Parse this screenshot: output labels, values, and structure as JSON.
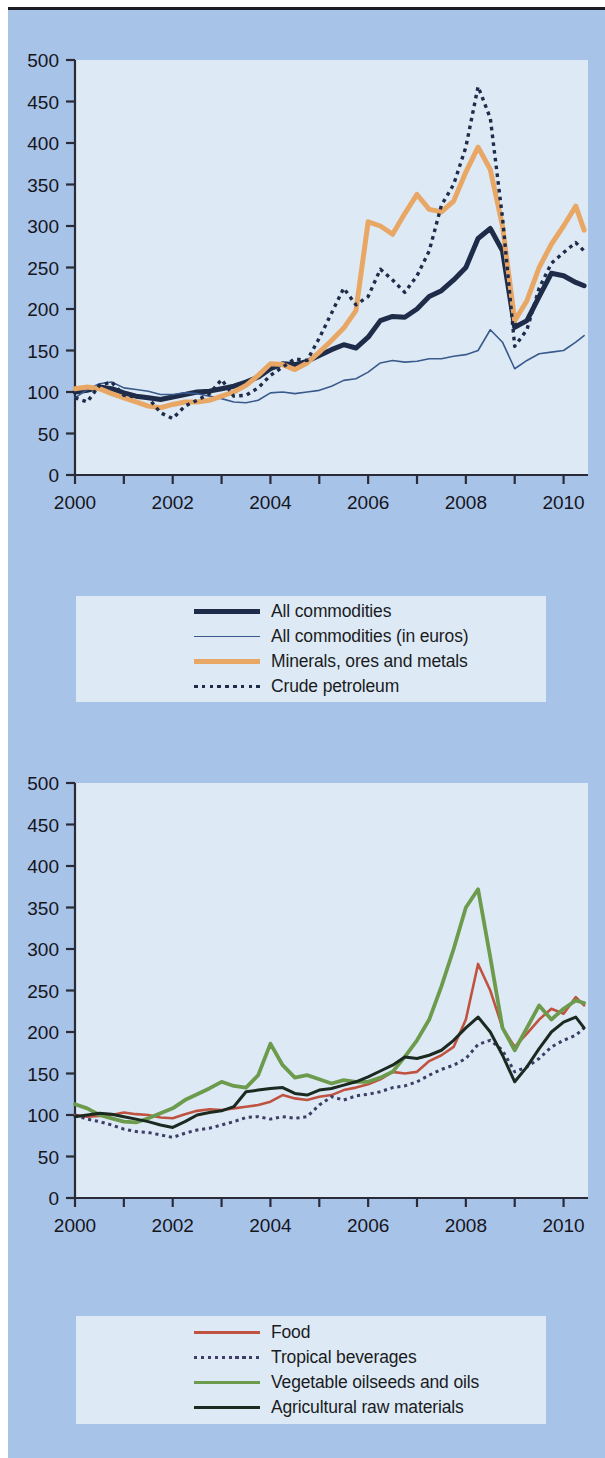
{
  "page": {
    "background_color": "#a8c3e8",
    "panel_color": "#ddeaf6",
    "rule_color": "#1c1c24"
  },
  "charts": [
    {
      "id": "commodity-price-indices-upper",
      "legend": {
        "entries": [
          {
            "label": "All commodities",
            "color": "#1e2c49",
            "style": "solid",
            "width": 5
          },
          {
            "label": "All commodities (in euros)",
            "color": "#3a5a8c",
            "style": "solid",
            "width": 1.6
          },
          {
            "label": "Minerals, ores and metals",
            "color": "#e9a765",
            "style": "solid",
            "width": 5
          },
          {
            "label": "Crude petroleum",
            "color": "#1e2c49",
            "style": "dotted",
            "width": 3.4
          }
        ]
      },
      "chart_data": {
        "type": "line",
        "title": "",
        "xlabel": "",
        "ylabel": "",
        "xlim": [
          2000,
          2010.5
        ],
        "ylim": [
          0,
          500
        ],
        "yticks": [
          0,
          50,
          100,
          150,
          200,
          250,
          300,
          350,
          400,
          450,
          500
        ],
        "xticks": [
          2000,
          2001,
          2002,
          2003,
          2004,
          2005,
          2006,
          2007,
          2008,
          2009,
          2010
        ],
        "xticklabels": [
          "2000",
          "",
          "2002",
          "",
          "2004",
          "",
          "2006",
          "",
          "2008",
          "",
          "2010"
        ],
        "grid": false,
        "legend_position": "below",
        "series": [
          {
            "name": "All commodities",
            "color": "#1e2c49",
            "style": "solid",
            "width": 5,
            "x": [
              2000.0,
              2000.25,
              2000.5,
              2000.75,
              2001.0,
              2001.25,
              2001.5,
              2001.75,
              2002.0,
              2002.25,
              2002.5,
              2002.75,
              2003.0,
              2003.25,
              2003.5,
              2003.75,
              2004.0,
              2004.25,
              2004.5,
              2004.75,
              2005.0,
              2005.25,
              2005.5,
              2005.75,
              2006.0,
              2006.25,
              2006.5,
              2006.75,
              2007.0,
              2007.25,
              2007.5,
              2007.75,
              2008.0,
              2008.25,
              2008.5,
              2008.75,
              2009.0,
              2009.25,
              2009.5,
              2009.75,
              2010.0,
              2010.25,
              2010.42
            ],
            "values": [
              100,
              102,
              106,
              104,
              99,
              95,
              93,
              91,
              94,
              97,
              100,
              101,
              104,
              107,
              112,
              118,
              128,
              134,
              133,
              137,
              144,
              151,
              157,
              153,
              166,
              186,
              191,
              190,
              200,
              215,
              222,
              235,
              250,
              285,
              297,
              270,
              178,
              186,
              215,
              243,
              240,
              232,
              228
            ]
          },
          {
            "name": "All commodities (in euros)",
            "color": "#3a5a8c",
            "style": "solid",
            "width": 1.6,
            "x": [
              2000.0,
              2000.25,
              2000.5,
              2000.75,
              2001.0,
              2001.25,
              2001.5,
              2001.75,
              2002.0,
              2002.25,
              2002.5,
              2002.75,
              2003.0,
              2003.25,
              2003.5,
              2003.75,
              2004.0,
              2004.25,
              2004.5,
              2004.75,
              2005.0,
              2005.25,
              2005.5,
              2005.75,
              2006.0,
              2006.25,
              2006.5,
              2006.75,
              2007.0,
              2007.25,
              2007.5,
              2007.75,
              2008.0,
              2008.25,
              2008.5,
              2008.75,
              2009.0,
              2009.25,
              2009.5,
              2009.75,
              2010.0,
              2010.25,
              2010.42
            ],
            "values": [
              93,
              103,
              110,
              112,
              105,
              103,
              101,
              97,
              97,
              99,
              98,
              95,
              92,
              88,
              87,
              90,
              99,
              100,
              98,
              100,
              102,
              107,
              114,
              116,
              124,
              135,
              138,
              136,
              137,
              140,
              140,
              143,
              145,
              150,
              175,
              160,
              128,
              138,
              146,
              148,
              150,
              160,
              168
            ]
          },
          {
            "name": "Minerals, ores and metals",
            "color": "#e9a765",
            "style": "solid",
            "width": 5,
            "x": [
              2000.0,
              2000.25,
              2000.5,
              2000.75,
              2001.0,
              2001.25,
              2001.5,
              2001.75,
              2002.0,
              2002.25,
              2002.5,
              2002.75,
              2003.0,
              2003.25,
              2003.5,
              2003.75,
              2004.0,
              2004.25,
              2004.5,
              2004.75,
              2005.0,
              2005.25,
              2005.5,
              2005.75,
              2006.0,
              2006.25,
              2006.5,
              2006.75,
              2007.0,
              2007.25,
              2007.5,
              2007.75,
              2008.0,
              2008.25,
              2008.5,
              2008.75,
              2009.0,
              2009.25,
              2009.5,
              2009.75,
              2010.0,
              2010.25,
              2010.42
            ],
            "values": [
              104,
              106,
              104,
              98,
              93,
              88,
              83,
              81,
              85,
              88,
              88,
              90,
              95,
              100,
              108,
              120,
              134,
              133,
              127,
              135,
              148,
              162,
              177,
              198,
              305,
              300,
              290,
              315,
              338,
              320,
              317,
              330,
              365,
              395,
              368,
              300,
              186,
              210,
              250,
              278,
              300,
              324,
              295
            ]
          },
          {
            "name": "Crude petroleum",
            "color": "#1e2c49",
            "style": "dotted",
            "width": 3.4,
            "x": [
              2000.0,
              2000.25,
              2000.5,
              2000.75,
              2001.0,
              2001.25,
              2001.5,
              2001.75,
              2002.0,
              2002.25,
              2002.5,
              2002.75,
              2003.0,
              2003.25,
              2003.5,
              2003.75,
              2004.0,
              2004.25,
              2004.5,
              2004.75,
              2005.0,
              2005.25,
              2005.5,
              2005.75,
              2006.0,
              2006.25,
              2006.5,
              2006.75,
              2007.0,
              2007.25,
              2007.5,
              2007.75,
              2008.0,
              2008.25,
              2008.5,
              2008.75,
              2009.0,
              2009.25,
              2009.5,
              2009.75,
              2010.0,
              2010.25,
              2010.42
            ],
            "values": [
              93,
              88,
              108,
              112,
              96,
              94,
              93,
              75,
              68,
              83,
              90,
              98,
              115,
              95,
              96,
              105,
              120,
              130,
              140,
              138,
              165,
              195,
              225,
              205,
              215,
              248,
              235,
              220,
              240,
              270,
              325,
              350,
              395,
              468,
              430,
              310,
              155,
              175,
              225,
              255,
              268,
              280,
              270
            ]
          }
        ]
      }
    },
    {
      "id": "commodity-price-indices-lower",
      "legend": {
        "entries": [
          {
            "label": "Food",
            "color": "#c05340",
            "style": "solid",
            "width": 2.6
          },
          {
            "label": "Tropical beverages",
            "color": "#3d3d66",
            "style": "dotted",
            "width": 3.0
          },
          {
            "label": "Vegetable oilseeds and oils",
            "color": "#6d9b4d",
            "style": "solid",
            "width": 3.8
          },
          {
            "label": "Agricultural raw materials",
            "color": "#1a2a20",
            "style": "solid",
            "width": 3.0
          }
        ]
      },
      "chart_data": {
        "type": "line",
        "title": "",
        "xlabel": "",
        "ylabel": "",
        "xlim": [
          2000,
          2010.5
        ],
        "ylim": [
          0,
          500
        ],
        "yticks": [
          0,
          50,
          100,
          150,
          200,
          250,
          300,
          350,
          400,
          450,
          500
        ],
        "xticks": [
          2000,
          2001,
          2002,
          2003,
          2004,
          2005,
          2006,
          2007,
          2008,
          2009,
          2010
        ],
        "xticklabels": [
          "2000",
          "",
          "2002",
          "",
          "2004",
          "",
          "2006",
          "",
          "2008",
          "",
          "2010"
        ],
        "grid": false,
        "legend_position": "below",
        "series": [
          {
            "name": "Food",
            "color": "#c05340",
            "style": "solid",
            "width": 2.6,
            "x": [
              2000.0,
              2000.25,
              2000.5,
              2000.75,
              2001.0,
              2001.25,
              2001.5,
              2001.75,
              2002.0,
              2002.25,
              2002.5,
              2002.75,
              2003.0,
              2003.25,
              2003.5,
              2003.75,
              2004.0,
              2004.25,
              2004.5,
              2004.75,
              2005.0,
              2005.25,
              2005.5,
              2005.75,
              2006.0,
              2006.25,
              2006.5,
              2006.75,
              2007.0,
              2007.25,
              2007.5,
              2007.75,
              2008.0,
              2008.25,
              2008.5,
              2008.75,
              2009.0,
              2009.25,
              2009.5,
              2009.75,
              2010.0,
              2010.25,
              2010.42
            ],
            "values": [
              100,
              98,
              99,
              100,
              103,
              101,
              100,
              97,
              96,
              101,
              105,
              107,
              106,
              108,
              110,
              112,
              116,
              124,
              120,
              118,
              122,
              124,
              130,
              133,
              137,
              143,
              152,
              150,
              152,
              165,
              172,
              182,
              215,
              282,
              250,
              205,
              182,
              198,
              215,
              228,
              222,
              242,
              232
            ]
          },
          {
            "name": "Tropical beverages",
            "color": "#3d3d66",
            "style": "dotted",
            "width": 3.0,
            "x": [
              2000.0,
              2000.25,
              2000.5,
              2000.75,
              2001.0,
              2001.25,
              2001.5,
              2001.75,
              2002.0,
              2002.25,
              2002.5,
              2002.75,
              2003.0,
              2003.25,
              2003.5,
              2003.75,
              2004.0,
              2004.25,
              2004.5,
              2004.75,
              2005.0,
              2005.25,
              2005.5,
              2005.75,
              2006.0,
              2006.25,
              2006.5,
              2006.75,
              2007.0,
              2007.25,
              2007.5,
              2007.75,
              2008.0,
              2008.25,
              2008.5,
              2008.75,
              2009.0,
              2009.25,
              2009.5,
              2009.75,
              2010.0,
              2010.25,
              2010.42
            ],
            "values": [
              100,
              95,
              92,
              88,
              83,
              80,
              79,
              76,
              73,
              78,
              82,
              84,
              88,
              92,
              97,
              98,
              95,
              98,
              96,
              98,
              112,
              122,
              118,
              123,
              125,
              128,
              133,
              135,
              140,
              148,
              155,
              160,
              168,
              185,
              190,
              178,
              152,
              158,
              168,
              182,
              190,
              196,
              205
            ]
          },
          {
            "name": "Vegetable oilseeds and oils",
            "color": "#6d9b4d",
            "style": "solid",
            "width": 3.8,
            "x": [
              2000.0,
              2000.25,
              2000.5,
              2000.75,
              2001.0,
              2001.25,
              2001.5,
              2001.75,
              2002.0,
              2002.25,
              2002.5,
              2002.75,
              2003.0,
              2003.25,
              2003.5,
              2003.75,
              2004.0,
              2004.25,
              2004.5,
              2004.75,
              2005.0,
              2005.25,
              2005.5,
              2005.75,
              2006.0,
              2006.25,
              2006.5,
              2006.75,
              2007.0,
              2007.25,
              2007.5,
              2007.75,
              2008.0,
              2008.25,
              2008.5,
              2008.75,
              2009.0,
              2009.25,
              2009.5,
              2009.75,
              2010.0,
              2010.25,
              2010.42
            ],
            "values": [
              113,
              108,
              100,
              96,
              92,
              91,
              96,
              102,
              108,
              118,
              125,
              132,
              140,
              135,
              133,
              148,
              186,
              160,
              145,
              148,
              143,
              138,
              142,
              140,
              140,
              145,
              152,
              170,
              190,
              215,
              255,
              300,
              350,
              372,
              290,
              205,
              178,
              205,
              232,
              215,
              228,
              238,
              235
            ]
          },
          {
            "name": "Agricultural raw materials",
            "color": "#1a2a20",
            "style": "solid",
            "width": 3.0,
            "x": [
              2000.0,
              2000.25,
              2000.5,
              2000.75,
              2001.0,
              2001.25,
              2001.5,
              2001.75,
              2002.0,
              2002.25,
              2002.5,
              2002.75,
              2003.0,
              2003.25,
              2003.5,
              2003.75,
              2004.0,
              2004.25,
              2004.5,
              2004.75,
              2005.0,
              2005.25,
              2005.5,
              2005.75,
              2006.0,
              2006.25,
              2006.5,
              2006.75,
              2007.0,
              2007.25,
              2007.5,
              2007.75,
              2008.0,
              2008.25,
              2008.5,
              2008.75,
              2009.0,
              2009.25,
              2009.5,
              2009.75,
              2010.0,
              2010.25,
              2010.42
            ],
            "values": [
              98,
              100,
              102,
              101,
              98,
              95,
              92,
              88,
              85,
              92,
              100,
              103,
              105,
              110,
              128,
              130,
              132,
              133,
              126,
              124,
              130,
              132,
              136,
              140,
              146,
              153,
              160,
              170,
              168,
              172,
              178,
              190,
              205,
              218,
              200,
              172,
              140,
              158,
              180,
              200,
              212,
              218,
              205
            ]
          }
        ]
      }
    }
  ]
}
